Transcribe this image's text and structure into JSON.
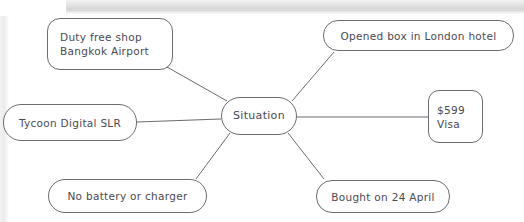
{
  "diagram": {
    "type": "mind-map",
    "center": {
      "id": "center",
      "label": "Situation"
    },
    "nodes": [
      {
        "id": "dutyfree",
        "lines": [
          "Duty free shop",
          "Bangkok Airport"
        ]
      },
      {
        "id": "openedbox",
        "lines": [
          "Opened box in London hotel"
        ]
      },
      {
        "id": "tycoon",
        "lines": [
          "Tycoon Digital SLR"
        ]
      },
      {
        "id": "price",
        "lines": [
          "$599",
          "Visa"
        ]
      },
      {
        "id": "battery",
        "lines": [
          "No battery or charger"
        ]
      },
      {
        "id": "bought",
        "lines": [
          "Bought on 24 April"
        ]
      }
    ],
    "colors": {
      "stroke": "#6b6b72",
      "text": "#4a4a52",
      "background": "#ffffff"
    }
  }
}
